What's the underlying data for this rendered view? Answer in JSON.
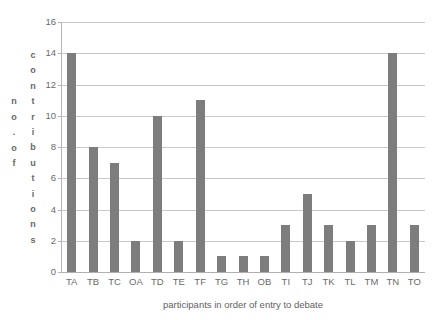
{
  "chart_data": {
    "type": "bar",
    "title": "",
    "xlabel": "participants in order of entry to debate",
    "ylabel": "no. of contributions",
    "ylabel_columns": {
      "outer": [
        "n",
        "o",
        ".",
        "o",
        "f"
      ],
      "inner": [
        "c",
        "o",
        "n",
        "t",
        "r",
        "i",
        "b",
        "u",
        "t",
        "i",
        "o",
        "n",
        "s"
      ]
    },
    "categories": [
      "TA",
      "TB",
      "TC",
      "OA",
      "TD",
      "TE",
      "TF",
      "TG",
      "TH",
      "OB",
      "TI",
      "TJ",
      "TK",
      "TL",
      "TM",
      "TN",
      "TO"
    ],
    "values": [
      14,
      8,
      7,
      2,
      10,
      2,
      11,
      1,
      1,
      1,
      3,
      5,
      3,
      2,
      3,
      14,
      3
    ],
    "ylim": [
      0,
      16
    ],
    "ytick_labels": [
      "0",
      "2",
      "4",
      "6",
      "8",
      "10",
      "12",
      "14",
      "16"
    ],
    "ytick_values": [
      0,
      2,
      4,
      6,
      8,
      10,
      12,
      14,
      16
    ],
    "grid": true,
    "legend": "none",
    "bar_color": "#7d7d7d",
    "gridline_color": "#c9c9c9",
    "axis_color": "#b5b5b5",
    "background_color": "#ffffff",
    "text_color": "#6a6a6a"
  }
}
